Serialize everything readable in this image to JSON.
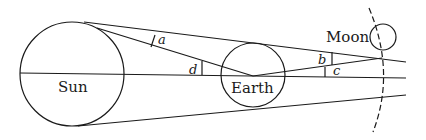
{
  "diagram": {
    "type": "astronomy-geometry",
    "stroke_color": "#1a1a1a",
    "bodies": {
      "sun": {
        "label": "Sun",
        "cx": 72,
        "cy": 74,
        "r": 52
      },
      "earth": {
        "label": "Earth",
        "cx": 253,
        "cy": 75,
        "r": 32
      },
      "moon": {
        "label": "Moon",
        "cx": 383,
        "cy": 37,
        "r": 13
      }
    },
    "angles": {
      "a": "a",
      "b": "b",
      "c": "c",
      "d": "d"
    }
  }
}
